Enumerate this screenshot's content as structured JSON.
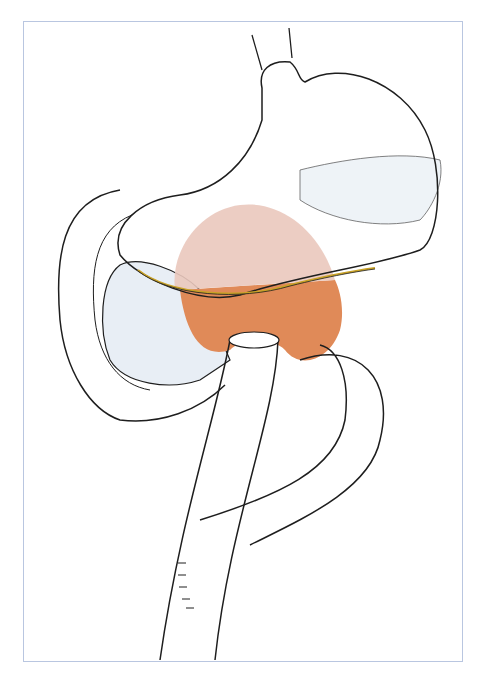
{
  "figure": {
    "title": "",
    "frame_color": "#b9c6e0",
    "colors": {
      "outline": "#1e1e1e",
      "pancreas_fill": "#e8eef5",
      "tumor_upper_fill": "#eac8bc",
      "tumor_lower_fill": "#e08a58",
      "resection_line": "#c9a227",
      "background": "#ffffff"
    },
    "structures": [
      "esophagus",
      "stomach",
      "pancreas",
      "tumor-region",
      "jejunal-loop",
      "anastomosis-sutures"
    ]
  }
}
